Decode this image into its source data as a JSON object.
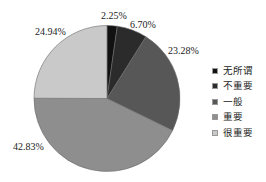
{
  "chart_data": {
    "type": "pie",
    "title": "",
    "categories": [
      "无所谓",
      "不重要",
      "一般",
      "重要",
      "很重要"
    ],
    "values": [
      2.25,
      6.7,
      23.28,
      42.83,
      24.94
    ],
    "labels": [
      "2.25%",
      "6.70%",
      "23.28%",
      "42.83%",
      "24.94%"
    ],
    "colors": [
      "#111111",
      "#2b2b2b",
      "#575757",
      "#8e8e8e",
      "#c9c9c9"
    ],
    "start_angle": "12 o'clock, clockwise",
    "legend_position": "right"
  },
  "legend": {
    "items": [
      {
        "label": "无所谓",
        "color": "#111111"
      },
      {
        "label": "不重要",
        "color": "#2b2b2b"
      },
      {
        "label": "一般",
        "color": "#575757"
      },
      {
        "label": "重要",
        "color": "#8e8e8e"
      },
      {
        "label": "很重要",
        "color": "#c9c9c9"
      }
    ]
  }
}
